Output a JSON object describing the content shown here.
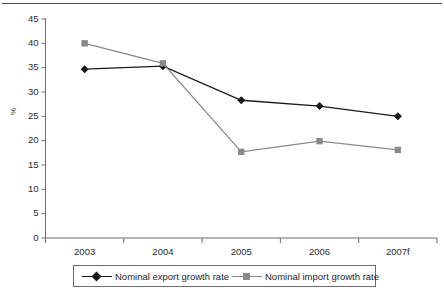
{
  "chart_data": {
    "type": "line",
    "title": "",
    "xlabel": "",
    "ylabel": "%",
    "categories": [
      "2003",
      "2004",
      "2005",
      "2006",
      "2007f"
    ],
    "ylim": [
      0,
      45
    ],
    "yticks": [
      0,
      5,
      10,
      15,
      20,
      25,
      30,
      35,
      40,
      45
    ],
    "ytick_labels": [
      "0",
      "5",
      "10",
      "15",
      "20",
      "25",
      "30",
      "35",
      "40",
      "45"
    ],
    "grid": false,
    "legend_position": "bottom",
    "series": [
      {
        "name": "Nominal export growth rate",
        "marker": "diamond",
        "color": "#1a1a1a",
        "values": [
          34.7,
          35.3,
          28.3,
          27.1,
          25.0
        ]
      },
      {
        "name": "Nominal import growth rate",
        "marker": "square",
        "color": "#8a8a8a",
        "values": [
          40.0,
          35.9,
          17.7,
          19.9,
          18.1
        ]
      }
    ]
  },
  "legend": {
    "entries": [
      {
        "label": "Nominal export growth rate"
      },
      {
        "label": "Nominal import growth rate"
      }
    ]
  },
  "axes": {
    "y_axis_label": "%",
    "y_tick_labels": [
      "45",
      "40",
      "35",
      "30",
      "25",
      "20",
      "15",
      "10",
      "5",
      "0"
    ],
    "x_tick_labels": [
      "2003",
      "2004",
      "2005",
      "2006",
      "2007f"
    ]
  },
  "colors": {
    "export_series": "#1a1a1a",
    "import_series": "#8a8a8a",
    "axis": "#6d6d6d",
    "text": "#2b2b2b",
    "background": "#ffffff"
  }
}
